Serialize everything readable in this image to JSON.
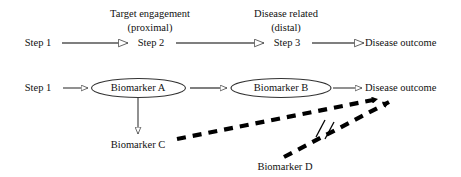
{
  "figure": {
    "type": "causal-pathway-diagram",
    "background_color": "#ffffff",
    "line_color": "#555555",
    "dashed_color": "#000000",
    "text_color": "#111111"
  },
  "annotations": {
    "target_engagement_line1": "Target engagement",
    "target_engagement_line2": "(proximal)",
    "disease_related_line1": "Disease related",
    "disease_related_line2": "(distal)"
  },
  "row_top": {
    "nodes": [
      {
        "label": "Step 1",
        "x": 38,
        "y": 42
      },
      {
        "label": "Step 2",
        "x": 150,
        "y": 42
      },
      {
        "label": "Step 3",
        "x": 286,
        "y": 42
      },
      {
        "label": "Disease outcome",
        "x": 402,
        "y": 42
      }
    ],
    "arrows": [
      {
        "from": "Step 1",
        "to": "Step 2",
        "style": "solid-open-head"
      },
      {
        "from": "Step 2",
        "to": "Step 3",
        "style": "solid-open-head"
      },
      {
        "from": "Step 3",
        "to": "Disease outcome",
        "style": "solid-open-head"
      }
    ]
  },
  "row_bottom": {
    "nodes": [
      {
        "label": "Step 1",
        "shape": "plain",
        "x": 38,
        "y": 88
      },
      {
        "label": "Biomarker A",
        "shape": "ellipse",
        "x": 138,
        "y": 88
      },
      {
        "label": "Biomarker B",
        "shape": "ellipse",
        "x": 281,
        "y": 88
      },
      {
        "label": "Disease outcome",
        "shape": "plain",
        "x": 404,
        "y": 88
      }
    ],
    "arrows": [
      {
        "from": "Step 1",
        "to": "Biomarker A",
        "style": "solid-open-head"
      },
      {
        "from": "Biomarker A",
        "to": "Biomarker B",
        "style": "solid-open-head"
      },
      {
        "from": "Biomarker B",
        "to": "Disease outcome",
        "style": "solid-open-head"
      },
      {
        "from": "Biomarker A",
        "to": "Biomarker C",
        "style": "solid-open-head-vertical"
      }
    ]
  },
  "lower_nodes": [
    {
      "label": "Biomarker C",
      "x": 138,
      "y": 145
    },
    {
      "label": "Biomarker D",
      "x": 285,
      "y": 167
    }
  ],
  "dashed_arrows": [
    {
      "name": "biomarker-c-to-disease-outcome",
      "from": "Biomarker C",
      "to": "Disease outcome",
      "style": "thick-dashed",
      "blocked": false
    },
    {
      "name": "biomarker-d-to-disease-outcome",
      "from": "Biomarker D",
      "to": "Disease outcome",
      "style": "thick-dashed",
      "blocked": true,
      "block_marker": "double-slash"
    }
  ]
}
